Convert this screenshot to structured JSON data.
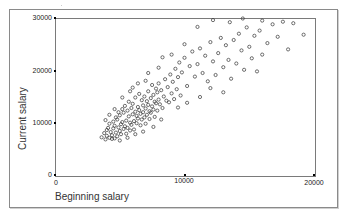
{
  "chart_data": {
    "type": "scatter",
    "title": "",
    "xlabel": "Beginning salary",
    "ylabel": "Current salary",
    "xlim": [
      0,
      20000
    ],
    "ylim": [
      0,
      30000
    ],
    "xticks": [
      "0",
      "10000",
      "20000"
    ],
    "yticks": [
      "0",
      "10000",
      "20000",
      "30000"
    ],
    "grid": false,
    "legend": null,
    "marker": "open-circle",
    "points": [
      [
        3600,
        7200
      ],
      [
        3800,
        8000
      ],
      [
        3900,
        6800
      ],
      [
        4000,
        7500
      ],
      [
        4000,
        8600
      ],
      [
        4100,
        9000
      ],
      [
        4200,
        7100
      ],
      [
        4200,
        9800
      ],
      [
        4300,
        8200
      ],
      [
        4400,
        7600
      ],
      [
        4500,
        10200
      ],
      [
        4500,
        8900
      ],
      [
        4600,
        7000
      ],
      [
        4600,
        9400
      ],
      [
        4700,
        11000
      ],
      [
        4700,
        8100
      ],
      [
        4800,
        7400
      ],
      [
        4800,
        10600
      ],
      [
        4900,
        9100
      ],
      [
        4900,
        12000
      ],
      [
        5000,
        8400
      ],
      [
        5000,
        11400
      ],
      [
        5100,
        9700
      ],
      [
        5100,
        7800
      ],
      [
        5200,
        12600
      ],
      [
        5200,
        10100
      ],
      [
        5300,
        8800
      ],
      [
        5300,
        11900
      ],
      [
        5400,
        9300
      ],
      [
        5400,
        13200
      ],
      [
        5500,
        10400
      ],
      [
        5500,
        7900
      ],
      [
        5600,
        12300
      ],
      [
        5600,
        9000
      ],
      [
        5700,
        11200
      ],
      [
        5700,
        14000
      ],
      [
        5800,
        10000
      ],
      [
        5800,
        8500
      ],
      [
        5900,
        12800
      ],
      [
        5900,
        9600
      ],
      [
        6000,
        11600
      ],
      [
        6000,
        13600
      ],
      [
        6100,
        10300
      ],
      [
        6100,
        8700
      ],
      [
        6200,
        12100
      ],
      [
        6200,
        14800
      ],
      [
        6300,
        9900
      ],
      [
        6300,
        11300
      ],
      [
        6400,
        13000
      ],
      [
        6400,
        10800
      ],
      [
        6500,
        15500
      ],
      [
        6500,
        12400
      ],
      [
        6600,
        9500
      ],
      [
        6600,
        11700
      ],
      [
        6700,
        14300
      ],
      [
        6700,
        10600
      ],
      [
        6800,
        13300
      ],
      [
        6800,
        12000
      ],
      [
        6900,
        11000
      ],
      [
        6900,
        15000
      ],
      [
        7000,
        12700
      ],
      [
        7000,
        9800
      ],
      [
        7100,
        14100
      ],
      [
        7100,
        11500
      ],
      [
        7200,
        16000
      ],
      [
        7200,
        13400
      ],
      [
        7300,
        10700
      ],
      [
        7300,
        12200
      ],
      [
        7400,
        14700
      ],
      [
        7400,
        11900
      ],
      [
        7500,
        17200
      ],
      [
        7500,
        13100
      ],
      [
        7600,
        12500
      ],
      [
        7600,
        15300
      ],
      [
        7700,
        11100
      ],
      [
        7700,
        14000
      ],
      [
        7800,
        13700
      ],
      [
        7800,
        16500
      ],
      [
        7900,
        12300
      ],
      [
        7900,
        15800
      ],
      [
        8000,
        14400
      ],
      [
        8000,
        17500
      ],
      [
        8100,
        13500
      ],
      [
        8200,
        16200
      ],
      [
        8300,
        12800
      ],
      [
        8400,
        15000
      ],
      [
        8500,
        18300
      ],
      [
        8600,
        14200
      ],
      [
        8700,
        16800
      ],
      [
        8800,
        13900
      ],
      [
        8900,
        19200
      ],
      [
        9000,
        15600
      ],
      [
        9100,
        17800
      ],
      [
        9200,
        14500
      ],
      [
        9300,
        20300
      ],
      [
        9400,
        16400
      ],
      [
        9500,
        18700
      ],
      [
        9600,
        21500
      ],
      [
        9700,
        15200
      ],
      [
        9800,
        19600
      ],
      [
        10000,
        22400
      ],
      [
        10200,
        17000
      ],
      [
        10400,
        20800
      ],
      [
        10600,
        23600
      ],
      [
        10800,
        18800
      ],
      [
        11000,
        21200
      ],
      [
        11200,
        24200
      ],
      [
        11400,
        19500
      ],
      [
        11600,
        22800
      ],
      [
        11800,
        17900
      ],
      [
        12000,
        25400
      ],
      [
        12200,
        21700
      ],
      [
        12400,
        19100
      ],
      [
        12600,
        23300
      ],
      [
        12800,
        26200
      ],
      [
        13000,
        20600
      ],
      [
        13200,
        24800
      ],
      [
        13400,
        22000
      ],
      [
        13600,
        18400
      ],
      [
        13800,
        25800
      ],
      [
        14000,
        21300
      ],
      [
        14200,
        27000
      ],
      [
        14400,
        23800
      ],
      [
        14600,
        20100
      ],
      [
        14800,
        28200
      ],
      [
        15000,
        24500
      ],
      [
        15200,
        22300
      ],
      [
        15400,
        26600
      ],
      [
        15600,
        19800
      ],
      [
        15800,
        27600
      ],
      [
        16000,
        23000
      ],
      [
        16400,
        25200
      ],
      [
        16800,
        28800
      ],
      [
        17200,
        26400
      ],
      [
        17600,
        29300
      ],
      [
        18000,
        24000
      ],
      [
        18400,
        29000
      ],
      [
        19200,
        26800
      ],
      [
        8200,
        10600
      ],
      [
        7600,
        9200
      ],
      [
        6800,
        8300
      ],
      [
        6200,
        7800
      ],
      [
        5600,
        7100
      ],
      [
        5000,
        6600
      ],
      [
        4400,
        6900
      ],
      [
        9500,
        12900
      ],
      [
        10200,
        13800
      ],
      [
        11200,
        14900
      ],
      [
        12000,
        16600
      ],
      [
        13000,
        15800
      ],
      [
        6000,
        16700
      ],
      [
        7000,
        18000
      ],
      [
        8000,
        20500
      ],
      [
        9000,
        23000
      ],
      [
        10000,
        25000
      ],
      [
        11000,
        28300
      ],
      [
        12200,
        29600
      ],
      [
        13500,
        29200
      ],
      [
        14500,
        29900
      ],
      [
        16000,
        29500
      ],
      [
        3900,
        10500
      ],
      [
        4200,
        11500
      ],
      [
        4600,
        12600
      ],
      [
        5200,
        14800
      ],
      [
        5800,
        16000
      ],
      [
        6400,
        17500
      ],
      [
        7200,
        19500
      ],
      [
        8300,
        22500
      ]
    ]
  }
}
